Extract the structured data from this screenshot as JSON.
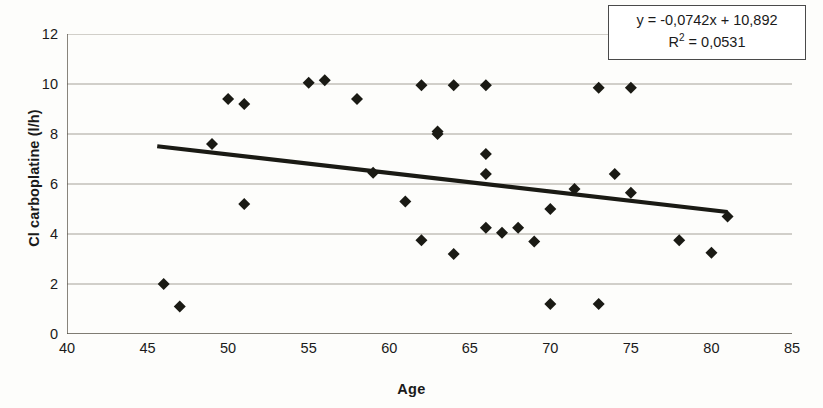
{
  "chart_data": {
    "type": "scatter",
    "title": "",
    "xlabel": "Age",
    "ylabel": "Cl carboplatine (l/h)",
    "xlim": [
      40,
      85
    ],
    "ylim": [
      0,
      12
    ],
    "x_ticks": [
      40,
      45,
      50,
      55,
      60,
      65,
      70,
      75,
      80,
      85
    ],
    "y_ticks": [
      0,
      2,
      4,
      6,
      8,
      10,
      12
    ],
    "grid": "horizontal",
    "legend": "none",
    "marker": "diamond",
    "marker_color": "#1a1a14",
    "trendline_color": "#1a1a14",
    "points": [
      {
        "x": 46.0,
        "y": 2.0
      },
      {
        "x": 47.0,
        "y": 1.1
      },
      {
        "x": 49.0,
        "y": 7.6
      },
      {
        "x": 50.0,
        "y": 9.4
      },
      {
        "x": 51.0,
        "y": 9.2
      },
      {
        "x": 51.0,
        "y": 5.2
      },
      {
        "x": 55.0,
        "y": 10.05
      },
      {
        "x": 56.0,
        "y": 10.15
      },
      {
        "x": 58.0,
        "y": 9.4
      },
      {
        "x": 59.0,
        "y": 6.45
      },
      {
        "x": 61.0,
        "y": 5.3
      },
      {
        "x": 62.0,
        "y": 9.95
      },
      {
        "x": 62.0,
        "y": 3.75
      },
      {
        "x": 63.0,
        "y": 8.1
      },
      {
        "x": 63.0,
        "y": 8.0
      },
      {
        "x": 64.0,
        "y": 9.95
      },
      {
        "x": 64.0,
        "y": 3.2
      },
      {
        "x": 66.0,
        "y": 9.95
      },
      {
        "x": 66.0,
        "y": 7.2
      },
      {
        "x": 66.0,
        "y": 6.4
      },
      {
        "x": 66.0,
        "y": 4.25
      },
      {
        "x": 67.0,
        "y": 4.05
      },
      {
        "x": 68.0,
        "y": 4.25
      },
      {
        "x": 69.0,
        "y": 3.7
      },
      {
        "x": 70.0,
        "y": 5.0
      },
      {
        "x": 70.0,
        "y": 1.2
      },
      {
        "x": 71.5,
        "y": 5.8
      },
      {
        "x": 73.0,
        "y": 9.85
      },
      {
        "x": 73.0,
        "y": 1.2
      },
      {
        "x": 74.0,
        "y": 6.4
      },
      {
        "x": 75.0,
        "y": 9.85
      },
      {
        "x": 75.0,
        "y": 5.65
      },
      {
        "x": 78.0,
        "y": 3.75
      },
      {
        "x": 80.0,
        "y": 3.25
      },
      {
        "x": 81.0,
        "y": 4.7
      }
    ],
    "trendline": {
      "slope": -0.0742,
      "intercept": 10.892,
      "x_start": 45.6,
      "x_end": 81.0,
      "y_start": 7.51,
      "y_end": 4.88
    },
    "annotations": {
      "equation": "y = -0,0742x + 10,892",
      "r_squared_prefix": "R",
      "r_squared_exponent": "2",
      "r_squared_value": " = 0,0531"
    }
  }
}
